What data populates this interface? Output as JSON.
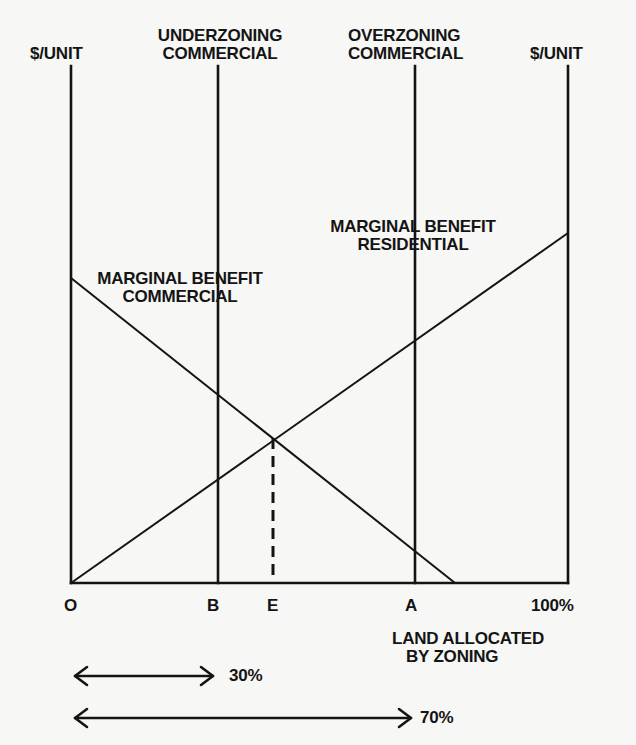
{
  "diagram": {
    "axes": {
      "left_y_label": "$/UNIT",
      "right_y_label": "$/UNIT",
      "x_title_line1": "LAND ALLOCATED",
      "x_title_line2": "BY ZONING"
    },
    "vertical_markers": {
      "underzoning": {
        "line1": "UNDERZONING",
        "line2": "COMMERCIAL"
      },
      "overzoning": {
        "line1": "OVERZONING",
        "line2": "COMMERCIAL"
      }
    },
    "curves": {
      "commercial": {
        "line1": "MARGINAL BENEFIT",
        "line2": "COMMERCIAL"
      },
      "residential": {
        "line1": "MARGINAL BENEFIT",
        "line2": "RESIDENTIAL"
      }
    },
    "x_ticks": [
      {
        "label": "O"
      },
      {
        "label": "B"
      },
      {
        "label": "E"
      },
      {
        "label": "A"
      },
      {
        "label": "100%"
      }
    ],
    "ranges": [
      {
        "label": "30%"
      },
      {
        "label": "70%"
      }
    ],
    "colors": {
      "ink": "#141414",
      "paper": "#f7f7f5"
    }
  }
}
